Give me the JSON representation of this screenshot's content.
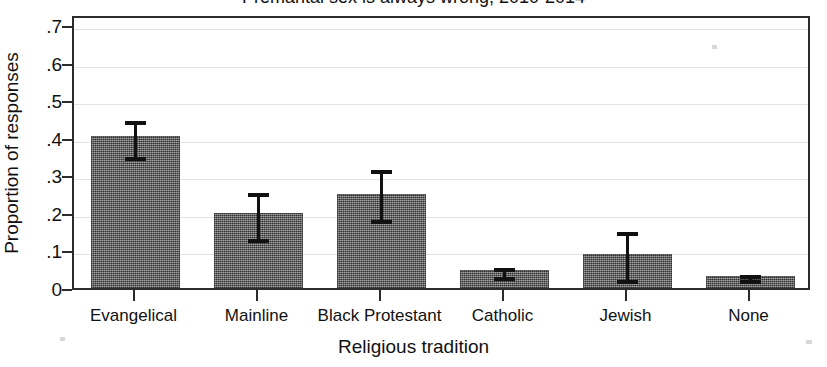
{
  "chart_data": {
    "type": "bar",
    "title": "Premarital sex is always wrong, 2010-2014",
    "xlabel": "Religious tradition",
    "ylabel": "Proportion of responses",
    "categories": [
      "Evangelical",
      "Mainline",
      "Black Protestant",
      "Catholic",
      "Jewish",
      "None"
    ],
    "values": [
      0.405,
      0.2,
      0.25,
      0.048,
      0.09,
      0.032
    ],
    "errors_low": [
      0.35,
      0.13,
      0.18,
      0.03,
      0.02,
      0.022
    ],
    "errors_high": [
      0.455,
      0.265,
      0.325,
      0.065,
      0.16,
      0.045
    ],
    "ylim": [
      0,
      0.73
    ],
    "ytick_values": [
      0,
      0.1,
      0.2,
      0.3,
      0.4,
      0.5,
      0.6,
      0.7
    ],
    "ytick_labels": [
      "0",
      ".1",
      ".2",
      ".3",
      ".4",
      ".5",
      ".6",
      ".7"
    ],
    "grid": true,
    "legend": null,
    "error_bar_kind": "95% confidence interval",
    "bar_color": "#6e6e6e",
    "axis_color": "#2b2b2b",
    "grid_color": "#e3e3e3"
  },
  "axes": {
    "y_title": "Proportion of responses",
    "x_title": "Religious tradition"
  },
  "header": {
    "title": "Premarital sex is always wrong, 2010-2014"
  }
}
